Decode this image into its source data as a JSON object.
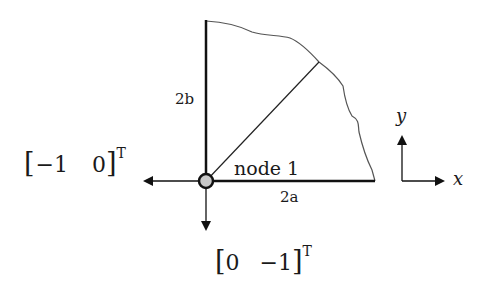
{
  "diagram": {
    "labels": {
      "height_label": "2b",
      "width_label": "2a",
      "node_label": "node 1",
      "axis_x": "x",
      "axis_y": "y"
    },
    "vectors": {
      "left": {
        "bracket_open": "[",
        "c1": "−1",
        "c2": "0",
        "bracket_close": "]",
        "sup": "T"
      },
      "down": {
        "bracket_open": "[",
        "c1": "0",
        "c2": "−1",
        "bracket_close": "]",
        "sup": "T"
      }
    },
    "colors": {
      "stroke": "#111111",
      "node_fill": "#c8c8c8",
      "outline": "#555555"
    }
  }
}
